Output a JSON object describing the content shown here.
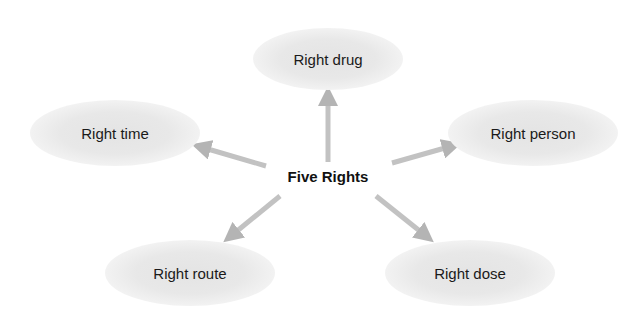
{
  "diagram": {
    "center_label": "Five Rights",
    "nodes": [
      {
        "id": "drug",
        "label": "Right drug"
      },
      {
        "id": "time",
        "label": "Right time"
      },
      {
        "id": "person",
        "label": "Right person"
      },
      {
        "id": "route",
        "label": "Right route"
      },
      {
        "id": "dose",
        "label": "Right dose"
      }
    ],
    "edges": [
      {
        "from": "Five Rights",
        "to": "Right drug"
      },
      {
        "from": "Five Rights",
        "to": "Right time"
      },
      {
        "from": "Five Rights",
        "to": "Right person"
      },
      {
        "from": "Five Rights",
        "to": "Right route"
      },
      {
        "from": "Five Rights",
        "to": "Right dose"
      }
    ],
    "colors": {
      "arrow": "#b4b4b4",
      "node_fill": "#e4e4e4",
      "text": "#1a1a1a"
    }
  }
}
